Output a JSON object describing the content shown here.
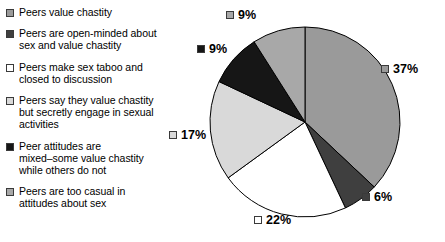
{
  "chart_data": {
    "type": "pie",
    "title": "",
    "subtitle": "",
    "xlabel": "",
    "ylabel": "",
    "grid": false,
    "legend_position": "left",
    "start_angle_deg": 0,
    "direction": "clockwise",
    "categories": [
      "Peers value chastity",
      "Peers are open-minded about sex and value chastity",
      "Peers make sex taboo and closed to discussion",
      "Peers say they value chastity but secretly engage in sexual activities",
      "Peer attitudes are mixed–some value chastity while others do not",
      "Peers are too casual in attitudes about sex"
    ],
    "values": [
      37,
      6,
      22,
      17,
      9,
      9
    ],
    "value_labels": [
      "37%",
      "6%",
      "22%",
      "17%",
      "9%",
      "9%"
    ],
    "colors": [
      "#9a9a9a",
      "#3f3f3f",
      "#ffffff",
      "#d9d9d9",
      "#161616",
      "#a8a8a8"
    ],
    "slice_border_color": "#000000"
  },
  "legend": {
    "items": [
      {
        "label": "Peers value chastity",
        "color": "#9a9a9a"
      },
      {
        "label": "Peers are open-minded about\nsex and value chastity",
        "color": "#3f3f3f"
      },
      {
        "label": "Peers make sex taboo and\nclosed to discussion",
        "color": "#ffffff"
      },
      {
        "label": "Peers say they value chastity\nbut secretly engage in sexual\nactivities",
        "color": "#d9d9d9"
      },
      {
        "label": "Peer attitudes are\nmixed–some value chastity\nwhile others do not",
        "color": "#161616"
      },
      {
        "label": "Peers are too casual in\nattitudes about sex",
        "color": "#a8a8a8"
      }
    ]
  },
  "callouts": [
    {
      "value": "37%",
      "color": "#9a9a9a"
    },
    {
      "value": "6%",
      "color": "#3f3f3f"
    },
    {
      "value": "22%",
      "color": "#ffffff"
    },
    {
      "value": "17%",
      "color": "#d9d9d9"
    },
    {
      "value": "9%",
      "color": "#161616"
    },
    {
      "value": "9%",
      "color": "#a8a8a8"
    }
  ]
}
